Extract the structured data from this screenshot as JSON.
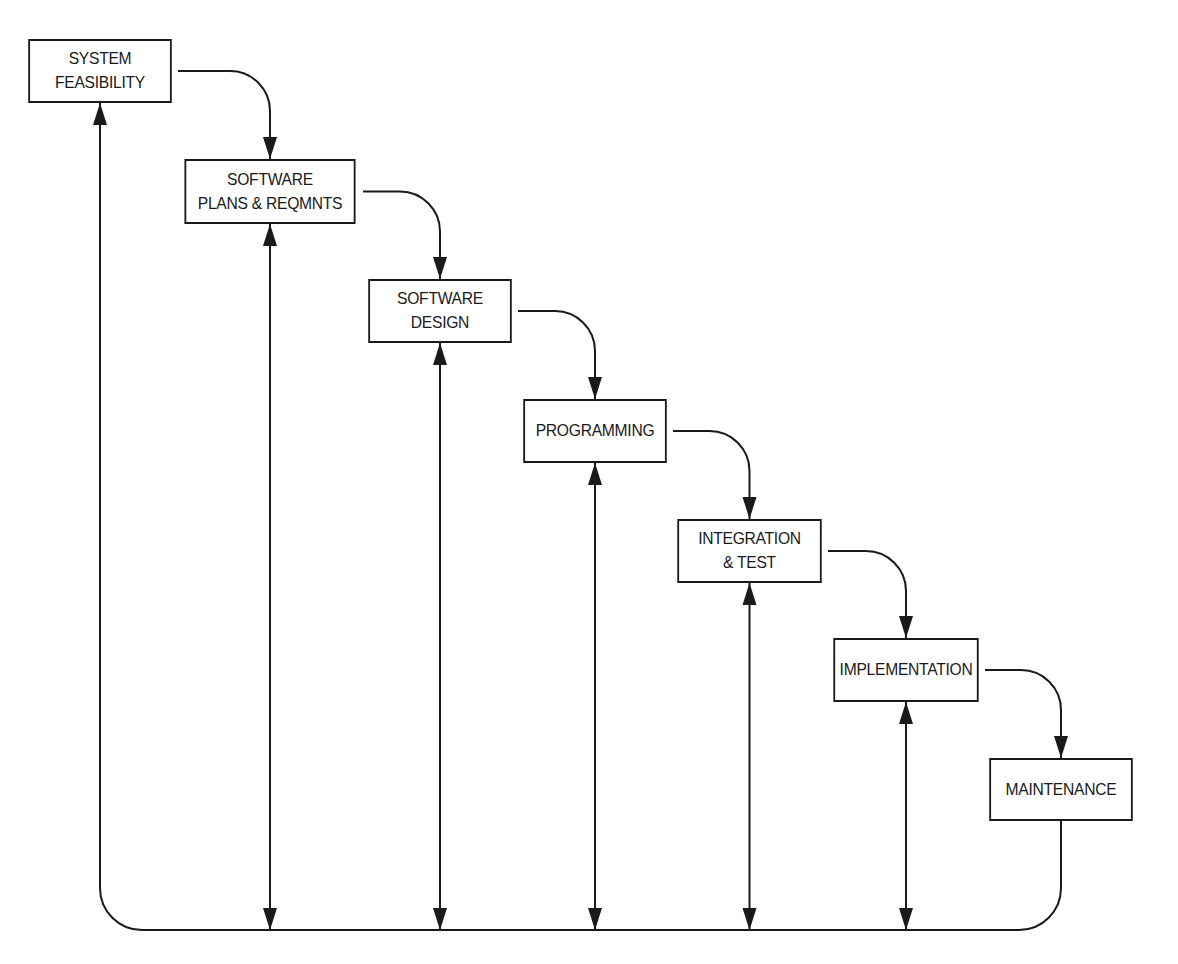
{
  "diagram": {
    "type": "waterfall-process-flow",
    "stages": [
      {
        "id": "system-feasibility",
        "lines": [
          "SYSTEM",
          "FEASIBILITY"
        ],
        "box": {
          "x": 22,
          "y": 39,
          "w": 156,
          "h": 64
        }
      },
      {
        "id": "software-plans-reqmnts",
        "lines": [
          "SOFTWARE",
          "PLANS & REQMNTS"
        ],
        "box": {
          "x": 177,
          "y": 159,
          "w": 186,
          "h": 65
        }
      },
      {
        "id": "software-design",
        "lines": [
          "SOFTWARE",
          "DESIGN"
        ],
        "box": {
          "x": 362,
          "y": 279,
          "w": 156,
          "h": 64
        }
      },
      {
        "id": "programming",
        "lines": [
          "PROGRAMMING"
        ],
        "box": {
          "x": 517,
          "y": 399,
          "w": 156,
          "h": 64
        }
      },
      {
        "id": "integration-test",
        "lines": [
          "INTEGRATION",
          "& TEST"
        ],
        "box": {
          "x": 671,
          "y": 519,
          "w": 157,
          "h": 64
        }
      },
      {
        "id": "implementation",
        "lines": [
          "IMPLEMENTATION"
        ],
        "box": {
          "x": 827,
          "y": 638,
          "w": 158,
          "h": 64
        }
      },
      {
        "id": "maintenance",
        "lines": [
          "MAINTENANCE"
        ],
        "box": {
          "x": 983,
          "y": 758,
          "w": 156,
          "h": 63
        }
      }
    ],
    "forward_arrows": [
      {
        "from": "system-feasibility",
        "to": "software-plans-reqmnts"
      },
      {
        "from": "software-plans-reqmnts",
        "to": "software-design"
      },
      {
        "from": "software-design",
        "to": "programming"
      },
      {
        "from": "programming",
        "to": "integration-test"
      },
      {
        "from": "integration-test",
        "to": "implementation"
      },
      {
        "from": "implementation",
        "to": "maintenance"
      }
    ],
    "feedback_bus": {
      "y": 930,
      "from": "maintenance",
      "return_to": "system-feasibility",
      "bidirectional_links": [
        "software-plans-reqmnts",
        "software-design",
        "programming",
        "integration-test",
        "implementation"
      ]
    },
    "colors": {
      "line": "#1a1a1a",
      "background": "#ffffff"
    }
  }
}
